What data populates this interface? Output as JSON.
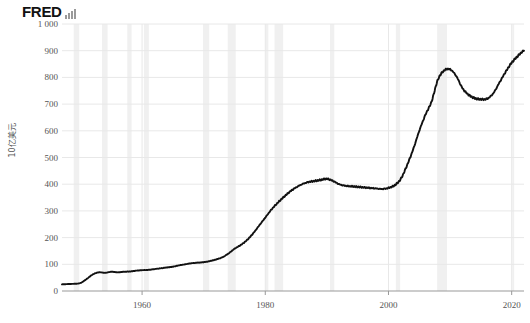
{
  "brand": {
    "name": "FRED",
    "mark_icon": "bar-chart-icon"
  },
  "axes": {
    "ylabel": "10亿美元",
    "yticks": [
      "1 000",
      "900",
      "800",
      "700",
      "600",
      "500",
      "400",
      "300",
      "200",
      "100",
      "0"
    ],
    "ytick_values": [
      1000,
      900,
      800,
      700,
      600,
      500,
      400,
      300,
      200,
      100,
      0
    ],
    "xticks": [
      "1960",
      "1980",
      "2000",
      "2020"
    ],
    "xtick_values": [
      1960,
      1980,
      2000,
      2020
    ]
  },
  "style": {
    "line_color": "#111111",
    "grid_color": "#e8e8e8",
    "axis_color": "#999999",
    "recession_color": "#f0f0f0",
    "background": "#ffffff",
    "text_color": "#555555"
  },
  "chart_data": {
    "type": "line",
    "title": "",
    "subtitle": "",
    "xlabel": "",
    "ylabel": "10亿美元",
    "xlim": [
      1947,
      2022
    ],
    "ylim": [
      0,
      1000
    ],
    "grid": true,
    "legend_position": "none",
    "annotations": [
      {
        "label": "recession-band",
        "type": "vspan"
      }
    ],
    "recessions": [
      [
        1948.9,
        1949.8
      ],
      [
        1953.5,
        1954.4
      ],
      [
        1957.6,
        1958.3
      ],
      [
        1960.3,
        1961.1
      ],
      [
        1969.9,
        1970.9
      ],
      [
        1973.9,
        1975.2
      ],
      [
        1980.0,
        1980.5
      ],
      [
        1981.5,
        1982.9
      ],
      [
        1990.5,
        1991.2
      ],
      [
        2001.2,
        2001.9
      ],
      [
        2007.9,
        2009.5
      ],
      [
        2020.1,
        2020.4
      ]
    ],
    "series": [
      {
        "name": "Value",
        "x": [
          1947.0,
          1948.0,
          1949.0,
          1950.0,
          1951.0,
          1952.0,
          1953.0,
          1954.0,
          1955.0,
          1956.0,
          1957.0,
          1958.0,
          1959.0,
          1960.0,
          1961.0,
          1962.0,
          1963.0,
          1964.0,
          1965.0,
          1966.0,
          1967.0,
          1968.0,
          1969.0,
          1970.0,
          1971.0,
          1972.0,
          1973.0,
          1974.0,
          1975.0,
          1976.0,
          1977.0,
          1978.0,
          1979.0,
          1980.0,
          1981.0,
          1982.0,
          1983.0,
          1984.0,
          1985.0,
          1986.0,
          1987.0,
          1988.0,
          1989.0,
          1990.0,
          1991.0,
          1992.0,
          1993.0,
          1994.0,
          1995.0,
          1996.0,
          1997.0,
          1998.0,
          1999.0,
          2000.0,
          2001.0,
          2002.0,
          2003.0,
          2004.0,
          2005.0,
          2006.0,
          2007.0,
          2008.0,
          2009.0,
          2010.0,
          2011.0,
          2012.0,
          2013.0,
          2014.0,
          2015.0,
          2016.0,
          2017.0,
          2018.0,
          2019.0,
          2020.0,
          2021.0,
          2022.0
        ],
        "y": [
          25,
          26,
          27,
          30,
          45,
          62,
          70,
          68,
          72,
          70,
          72,
          73,
          76,
          78,
          79,
          82,
          85,
          88,
          91,
          96,
          100,
          104,
          106,
          108,
          112,
          118,
          126,
          140,
          158,
          172,
          190,
          215,
          245,
          275,
          305,
          330,
          352,
          372,
          388,
          400,
          408,
          412,
          416,
          420,
          412,
          400,
          394,
          392,
          390,
          388,
          386,
          384,
          382,
          386,
          396,
          420,
          470,
          530,
          600,
          660,
          710,
          790,
          825,
          830,
          805,
          760,
          735,
          722,
          718,
          720,
          740,
          780,
          820,
          855,
          880,
          900
        ]
      }
    ]
  }
}
